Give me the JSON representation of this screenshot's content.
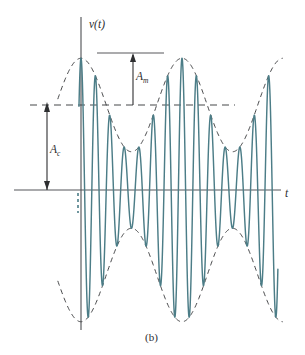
{
  "figure": {
    "caption": "(b)",
    "y_axis_label": "v(t)",
    "x_axis_label": "t",
    "amplitude_modulation_label": "A",
    "amplitude_modulation_subscript": "m",
    "amplitude_carrier_label": "A",
    "amplitude_carrier_subscript": "c",
    "waveform_color": "#4c7d87",
    "envelope_color": "#3c3d3f",
    "axis_color": "#55575a",
    "annotation_color": "#2e2f31",
    "background_color": "#ffffff"
  },
  "chart_data": {
    "type": "line",
    "title": "",
    "subtitle": "(b)",
    "xlabel": "t",
    "ylabel": "v(t)",
    "grid": false,
    "legend_position": "none",
    "xlim": [
      -0.23,
      2.05
    ],
    "ylim": [
      -1.62,
      1.62
    ],
    "annotations": [
      {
        "name": "A_m",
        "label": "A",
        "subscript": "m",
        "meaning": "modulation (peak) amplitude",
        "value": 0.55,
        "from_y": 1.0,
        "to_y": 1.55,
        "at_x": 0.52
      },
      {
        "name": "A_c",
        "label": "A",
        "subscript": "c",
        "meaning": "carrier amplitude",
        "value": 1.0,
        "from_y": 0.0,
        "to_y": 1.0,
        "at_x": -0.34
      }
    ],
    "series": [
      {
        "name": "v(t) modulated carrier",
        "kind": "am-signal",
        "color": "#4c7d87",
        "dashed": false,
        "carrier_amplitude": 1.0,
        "modulation_index": 0.55,
        "carrier_cycles_per_envelope_period": 7,
        "envelope_period_px": 101,
        "start_x": -0.02,
        "end_x": 1.95
      },
      {
        "name": "upper envelope",
        "kind": "envelope-upper",
        "color": "#3c3d3f",
        "dashed": true,
        "formula": "1 + 0.55*cos(2*pi*t)"
      },
      {
        "name": "lower envelope",
        "kind": "envelope-lower",
        "color": "#3c3d3f",
        "dashed": true,
        "formula": "-(1 + 0.55*cos(2*pi*t))"
      },
      {
        "name": "carrier level reference",
        "kind": "level-line",
        "color": "#3c3d3f",
        "dashed": true,
        "y": 1.0
      }
    ]
  },
  "geometry": {
    "origin_x": 81,
    "origin_y": 190,
    "x_axis_end": 281,
    "y_axis_top": 17,
    "y_axis_bottom": 330,
    "unit_y_px": 85,
    "envelope_period_px": 101,
    "carrier_period_px": 14.43,
    "level_line_y": 105,
    "measure_line_y": 53,
    "am_arrow_x": 133,
    "ac_arrow_x": 47,
    "am_label_x": 137,
    "am_label_y": 80,
    "ac_label_x": 51,
    "ac_label_y": 152,
    "caption_x": 147,
    "caption_y": 340,
    "y_label_x": 89,
    "y_label_y": 28,
    "x_label_x": 285,
    "x_label_y": 196
  }
}
